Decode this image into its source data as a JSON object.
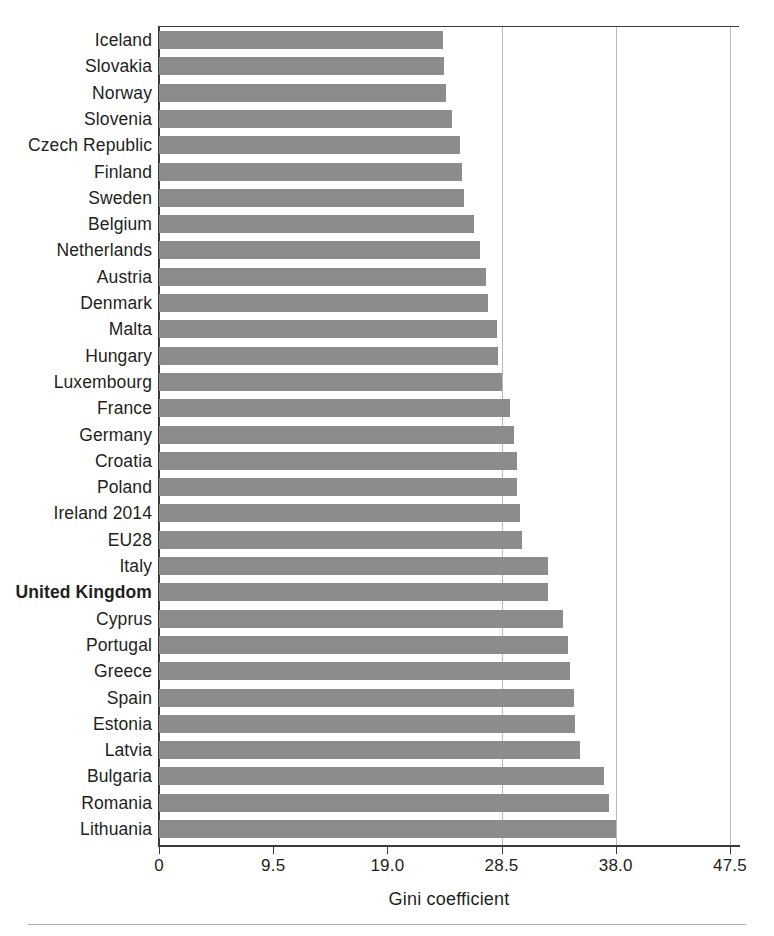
{
  "chart_data": {
    "type": "bar",
    "orientation": "horizontal",
    "title": "",
    "subtitle": "",
    "xlabel": "Gini coefficient",
    "ylabel": "",
    "xlim": [
      0,
      48.3
    ],
    "grid": "vertical gridlines at 28.5 and 38.0",
    "legend": "none",
    "highlight_category": "United Kingdom",
    "bar_color": "#8c8c8c",
    "xticks": [
      0,
      9.5,
      19.0,
      28.5,
      38.0,
      47.5
    ],
    "xtick_labels": [
      "0",
      "9.5",
      "19.0",
      "28.5",
      "38.0",
      "47.5"
    ],
    "categories": [
      "Iceland",
      "Slovakia",
      "Norway",
      "Slovenia",
      "Czech Republic",
      "Finland",
      "Sweden",
      "Belgium",
      "Netherlands",
      "Austria",
      "Denmark",
      "Malta",
      "Hungary",
      "Luxembourg",
      "France",
      "Germany",
      "Croatia",
      "Poland",
      "Ireland 2014",
      "EU28",
      "Italy",
      "United Kingdom",
      "Cyprus",
      "Portugal",
      "Greece",
      "Spain",
      "Estonia",
      "Latvia",
      "Bulgaria",
      "Romania",
      "Lithuania"
    ],
    "values": [
      23.6,
      23.7,
      23.9,
      24.4,
      25.0,
      25.2,
      25.4,
      26.2,
      26.7,
      27.2,
      27.4,
      28.1,
      28.2,
      28.5,
      29.2,
      29.5,
      29.8,
      29.8,
      30.0,
      30.2,
      32.4,
      32.4,
      33.6,
      34.0,
      34.2,
      34.5,
      34.6,
      35.0,
      37.0,
      37.4,
      38.0
    ]
  },
  "axis": {
    "x_title": "Gini coefficient"
  }
}
